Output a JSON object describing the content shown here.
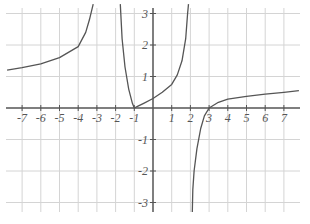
{
  "chart_data": {
    "type": "line",
    "title": "",
    "xlabel": "",
    "ylabel": "",
    "xlim": [
      -7.8,
      7.8
    ],
    "ylim": [
      -3.3,
      3.3
    ],
    "grid": true,
    "legend": null,
    "x_ticks": [
      -7,
      -6,
      -5,
      -4,
      -3,
      -2,
      -1,
      1,
      2,
      3,
      4,
      5,
      6,
      7
    ],
    "x_tick_labels": [
      "-7",
      "-6",
      "-5",
      "-4",
      "-3",
      "-2",
      "-1",
      "1",
      "2",
      "3",
      "4",
      "5",
      "6",
      "7"
    ],
    "y_ticks": [
      3,
      2,
      1,
      -1,
      -2,
      -3
    ],
    "y_tick_labels": [
      "3",
      "2",
      "1",
      "-1",
      "-2",
      "-3"
    ],
    "vertical_asymptotes_approx": [
      -3.2,
      -1.8,
      2.0
    ],
    "annotations": [],
    "series": [
      {
        "name": "branch-left",
        "points": [
          [
            -7.8,
            1.2
          ],
          [
            -7,
            1.28
          ],
          [
            -6,
            1.4
          ],
          [
            -5,
            1.6
          ],
          [
            -4,
            1.95
          ],
          [
            -3.6,
            2.4
          ],
          [
            -3.4,
            2.8
          ],
          [
            -3.2,
            3.3
          ]
        ]
      },
      {
        "name": "branch-middle",
        "points": [
          [
            -1.75,
            3.3
          ],
          [
            -1.65,
            2.2
          ],
          [
            -1.5,
            1.3
          ],
          [
            -1.3,
            0.6
          ],
          [
            -1.1,
            0.15
          ],
          [
            -1,
            0
          ],
          [
            -0.8,
            0.06
          ],
          [
            -0.5,
            0.15
          ],
          [
            0,
            0.3
          ],
          [
            0.5,
            0.5
          ],
          [
            1,
            0.75
          ],
          [
            1.3,
            1.05
          ],
          [
            1.55,
            1.5
          ],
          [
            1.75,
            2.2
          ],
          [
            1.85,
            3.0
          ],
          [
            1.9,
            3.3
          ]
        ]
      },
      {
        "name": "branch-right",
        "points": [
          [
            2.1,
            -3.3
          ],
          [
            2.13,
            -2.6
          ],
          [
            2.2,
            -2.0
          ],
          [
            2.35,
            -1.3
          ],
          [
            2.55,
            -0.65
          ],
          [
            2.75,
            -0.25
          ],
          [
            3,
            0
          ],
          [
            3.5,
            0.18
          ],
          [
            4,
            0.28
          ],
          [
            5,
            0.37
          ],
          [
            6,
            0.44
          ],
          [
            7,
            0.5
          ],
          [
            7.8,
            0.55
          ]
        ]
      }
    ]
  },
  "colors": {
    "grid": "#d4d4d4",
    "axis": "#555555",
    "curve": "#555555",
    "label": "#555555"
  }
}
